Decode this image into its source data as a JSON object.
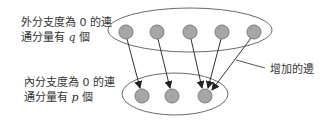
{
  "labels": {
    "out_line1": "外分支度為 0 的連",
    "out_line2_pre": "通分量有 ",
    "out_var": "q",
    "out_line2_post": " 個",
    "in_line1": "內分支度為 0 的連",
    "in_line2_pre": "通分量有 ",
    "in_var": "p",
    "in_line2_post": " 個",
    "added_edges": "增加的邊"
  },
  "colors": {
    "node_fill": "#a6a6a6",
    "node_stroke": "#7a7a7a",
    "ellipse_stroke": "#6a6a6a",
    "edge": "#333333",
    "text": "#333333"
  },
  "diagram": {
    "top_group": {
      "cx": 190,
      "cy": 30,
      "rx": 82,
      "ry": 22,
      "node_count": 5
    },
    "bottom_group": {
      "cx": 175,
      "cy": 94,
      "rx": 53,
      "ry": 21,
      "node_count": 3
    },
    "top_nodes": [
      [
        126,
        32
      ],
      [
        157,
        32
      ],
      [
        190,
        32
      ],
      [
        222,
        32
      ],
      [
        254,
        32
      ]
    ],
    "bottom_nodes": [
      [
        142,
        96
      ],
      [
        172,
        96
      ],
      [
        205,
        96
      ]
    ],
    "edges": [
      [
        0,
        0
      ],
      [
        1,
        1
      ],
      [
        2,
        2
      ],
      [
        3,
        2
      ],
      [
        4,
        2
      ]
    ]
  }
}
